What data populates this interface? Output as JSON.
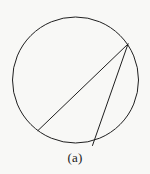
{
  "figure": {
    "caption": "(a)",
    "background_color": "#f8f8f6",
    "stroke_color": "#1f1f1f",
    "stroke_width": 1,
    "circle": {
      "name": "circle-outline",
      "cx": 75.5,
      "cy": 80,
      "r": 63
    },
    "chords": [
      {
        "name": "chord-long",
        "x1": 128,
        "y1": 44,
        "x2": 38,
        "y2": 130.5
      },
      {
        "name": "chord-short",
        "x1": 128,
        "y1": 44,
        "x2": 92.5,
        "y2": 145.5
      }
    ],
    "vertex": {
      "name": "inscribed-angle-vertex",
      "x": 128,
      "y": 44
    }
  },
  "chart_data": {
    "type": "diagram",
    "title": "(a)",
    "shapes": [
      {
        "kind": "circle",
        "cx": 75.5,
        "cy": 80,
        "r": 63
      },
      {
        "kind": "line",
        "x1": 128,
        "y1": 44,
        "x2": 38,
        "y2": 130.5
      },
      {
        "kind": "line",
        "x1": 128,
        "y1": 44,
        "x2": 92.5,
        "y2": 145.5
      }
    ]
  }
}
